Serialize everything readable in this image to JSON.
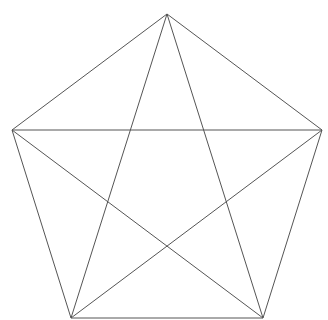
{
  "diagram": {
    "type": "complete-graph-K5",
    "stroke_color": "#555555",
    "background": "#ffffff",
    "vertices": [
      {
        "id": "top",
        "x": 167,
        "y": 14
      },
      {
        "id": "right",
        "x": 322,
        "y": 130
      },
      {
        "id": "bottom-right",
        "x": 263,
        "y": 318
      },
      {
        "id": "bottom-left",
        "x": 71,
        "y": 318
      },
      {
        "id": "left",
        "x": 12,
        "y": 130
      }
    ],
    "edges": [
      [
        "top",
        "right"
      ],
      [
        "right",
        "bottom-right"
      ],
      [
        "bottom-right",
        "bottom-left"
      ],
      [
        "bottom-left",
        "left"
      ],
      [
        "left",
        "top"
      ],
      [
        "top",
        "bottom-right"
      ],
      [
        "top",
        "bottom-left"
      ],
      [
        "right",
        "bottom-left"
      ],
      [
        "right",
        "left"
      ],
      [
        "bottom-right",
        "left"
      ]
    ]
  }
}
